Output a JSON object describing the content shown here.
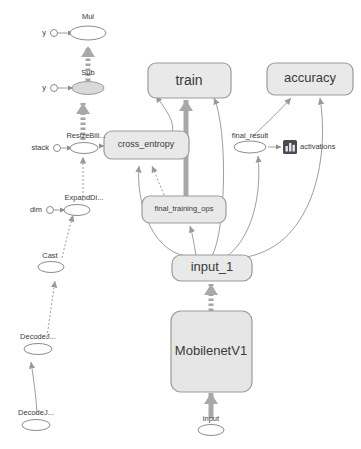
{
  "graph": {
    "title": "TensorFlow graph",
    "background_color": "#ffffff",
    "node_fill": "#e9e9e9",
    "node_stroke": "#9b9b9b",
    "edge_color": "#9e9e9e",
    "summary_icon_color": "#4a4a55"
  },
  "nodes": {
    "mul": {
      "label": "Mul",
      "type": "op"
    },
    "mul_y": {
      "label": "y",
      "type": "constant"
    },
    "sub": {
      "label": "Sub",
      "type": "op"
    },
    "sub_y": {
      "label": "y",
      "type": "constant"
    },
    "resize_bilinear": {
      "label": "ResizeBili...",
      "type": "op"
    },
    "stack": {
      "label": "stack",
      "type": "constant"
    },
    "expand_dims": {
      "label": "ExpandDi...",
      "type": "op"
    },
    "dim": {
      "label": "dim",
      "type": "constant"
    },
    "cast": {
      "label": "Cast",
      "type": "op"
    },
    "decode_jpeg_1": {
      "label": "DecodeJ...",
      "type": "op"
    },
    "decode_jpeg_2": {
      "label": "DecodeJ...",
      "type": "op"
    },
    "train": {
      "label": "train",
      "type": "group"
    },
    "accuracy": {
      "label": "accuracy",
      "type": "group"
    },
    "cross_entropy": {
      "label": "cross_entropy",
      "type": "group"
    },
    "final_training_ops": {
      "label": "final_training_ops",
      "type": "group"
    },
    "final_result": {
      "label": "final_result",
      "type": "op"
    },
    "activations": {
      "label": "activations",
      "type": "summary"
    },
    "input_1": {
      "label": "input_1",
      "type": "group"
    },
    "mobilenet_v1": {
      "label": "MobilenetV1",
      "type": "group"
    },
    "input": {
      "label": "input",
      "type": "op"
    }
  }
}
